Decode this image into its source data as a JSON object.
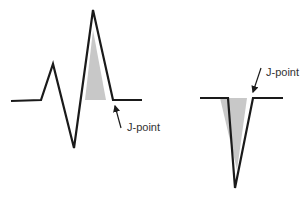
{
  "figure": {
    "colors": {
      "waveform": "#1a1a1a",
      "shading": "#c8c8c8",
      "label": "#333333",
      "background": "#ffffff"
    },
    "panels": [
      {
        "name": "qrs-complex-upright",
        "label": "J-point",
        "waveform_points": "11,101 41,100 53,64 74,148 93,10 113,100 142,100",
        "shade_points": "85,100 106,100 93,30",
        "arrow": {
          "x1": 121,
          "y1": 128,
          "x2": 115,
          "y2": 106
        },
        "label_pos": {
          "x": 127,
          "y": 131
        }
      },
      {
        "name": "qrs-complex-inverted",
        "label": "J-point",
        "waveform_points": "200,98 228,98 235,188 253,98 283,98",
        "shade_points": "220,98 247,98 237,170",
        "arrow": {
          "x1": 261,
          "y1": 68,
          "x2": 253,
          "y2": 92
        },
        "label_pos": {
          "x": 266,
          "y": 76
        }
      }
    ]
  }
}
